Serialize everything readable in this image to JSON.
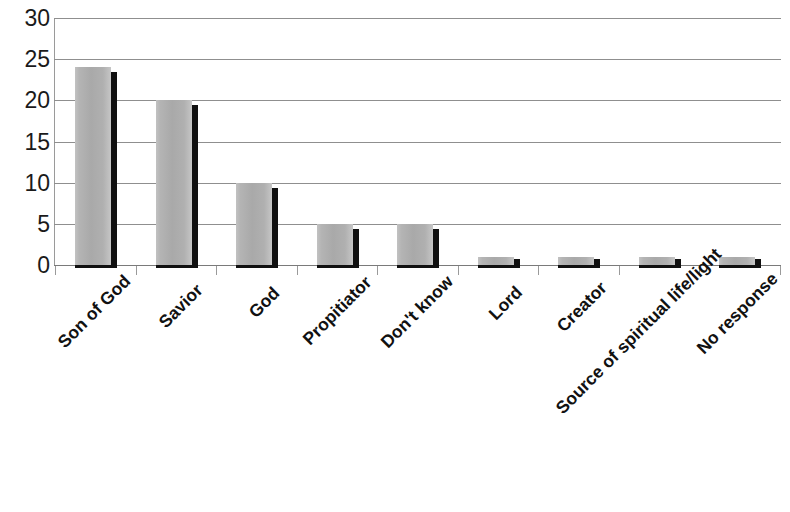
{
  "chart_data": {
    "type": "bar",
    "title": "",
    "subtitle": "",
    "xlabel": "",
    "ylabel": "",
    "ylim": [
      0,
      30
    ],
    "yticks": [
      0,
      5,
      10,
      15,
      20,
      25,
      30
    ],
    "ytick_labels": [
      "0",
      "5",
      "10",
      "15",
      "20",
      "25",
      "30"
    ],
    "grid": true,
    "legend": false,
    "legend_position": "none",
    "categories": [
      "Son of God",
      "Savior",
      "God",
      "Propitiator",
      "Don't know",
      "Lord",
      "Creator",
      "Source of spiritual life/light",
      "No response"
    ],
    "values": [
      24,
      20,
      10,
      5,
      5,
      1,
      1,
      1,
      1
    ],
    "series": [
      {
        "name": "Responses",
        "values": [
          24,
          20,
          10,
          5,
          5,
          1,
          1,
          1,
          1
        ],
        "color": "#adadad"
      }
    ],
    "colors": {
      "bar_fill": "#adadad",
      "bar_shadow": "#101010",
      "gridline": "#8f8f8f",
      "axis": "#9a9a9a",
      "text": "#111111",
      "background": "#ffffff"
    }
  }
}
